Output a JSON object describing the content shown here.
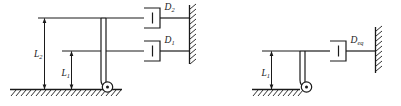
{
  "diagram": {
    "type": "mechanical-schematic",
    "colors": {
      "line": "#1a1a1a",
      "background": "#ffffff",
      "fill": "#ffffff"
    },
    "panels": [
      {
        "id": "left-panel",
        "name": "two-damper-system",
        "dampers": [
          {
            "id": "damper-d2",
            "label": "D",
            "subscript": "2",
            "label_full": "D2",
            "height_level": "L2"
          },
          {
            "id": "damper-d1",
            "label": "D",
            "subscript": "1",
            "label_full": "D1",
            "height_level": "L1"
          }
        ],
        "dimensions": [
          {
            "id": "dim-l2",
            "label": "L",
            "subscript": "2",
            "label_full": "L2"
          },
          {
            "id": "dim-l1",
            "label": "L",
            "subscript": "1",
            "label_full": "L1"
          }
        ]
      },
      {
        "id": "right-panel",
        "name": "equivalent-damper-system",
        "dampers": [
          {
            "id": "damper-deq",
            "label": "D",
            "subscript": "eq",
            "label_full": "Deq",
            "height_level": "L1"
          }
        ],
        "dimensions": [
          {
            "id": "dim-l1-right",
            "label": "L",
            "subscript": "1",
            "label_full": "L1"
          }
        ]
      }
    ]
  }
}
